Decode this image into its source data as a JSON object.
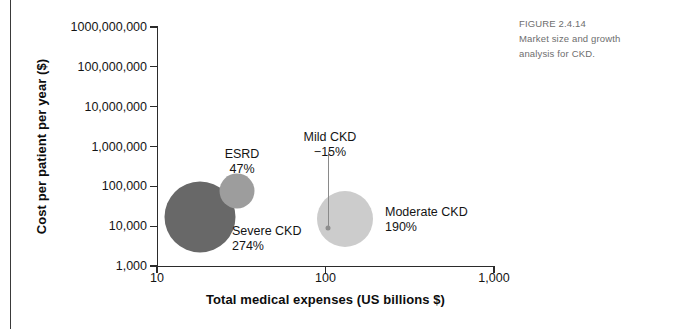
{
  "caption": {
    "figure_number": "FIGURE 2.4.14",
    "line1": "Market size and growth",
    "line2": "analysis for CKD."
  },
  "chart_data": {
    "type": "scatter",
    "title": "",
    "xlabel": "Total medical expenses (US billions $)",
    "ylabel": "Cost per patient per year ($)",
    "xscale": "log",
    "yscale": "log",
    "xlim": [
      10,
      1000
    ],
    "ylim": [
      1000,
      1000000000
    ],
    "grid": false,
    "legend": "none",
    "xticks": [
      "10",
      "100",
      "1,000"
    ],
    "xtick_values": [
      10,
      100,
      1000
    ],
    "yticks": [
      "1,000",
      "10,000",
      "100,000",
      "1,000,000",
      "10,000,000",
      "100,000,000",
      "1000,000,000"
    ],
    "ytick_values": [
      1000,
      10000,
      100000,
      1000000,
      10000000,
      100000000,
      1000000000
    ],
    "points": [
      {
        "name": "Severe CKD",
        "label_line1": "Severe CKD",
        "label_line2": "274%",
        "growth": "274%",
        "x": 18,
        "y": 17000,
        "size_px": 71,
        "color": "#686868"
      },
      {
        "name": "ESRD",
        "label_line1": "ESRD",
        "label_line2": "47%",
        "growth": "47%",
        "x": 30,
        "y": 78000,
        "size_px": 35,
        "color": "#9d9d9d"
      },
      {
        "name": "Moderate CKD",
        "label_line1": "Moderate CKD",
        "label_line2": "190%",
        "growth": "190%",
        "x": 130,
        "y": 15000,
        "size_px": 56,
        "color": "#cccccc"
      },
      {
        "name": "Mild CKD",
        "label_line1": "Mild CKD",
        "label_line2": "−15%",
        "growth": "−15%",
        "x": 103,
        "y": 9000,
        "size_px": 5,
        "color": "#8d8d8d"
      }
    ]
  }
}
